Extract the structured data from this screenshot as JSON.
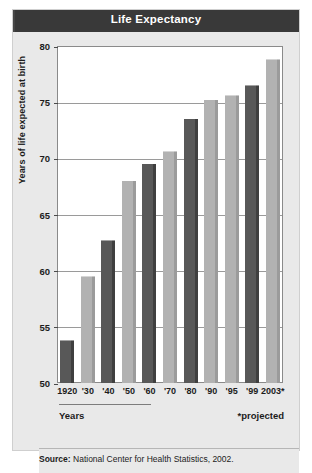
{
  "header": {
    "title": "Life Expectancy"
  },
  "axis": {
    "y_title": "Years of life expected at birth",
    "x_title": "Years",
    "footnote": "*projected"
  },
  "source": {
    "label": "Source:",
    "text": "National Center for Health Statistics, 2002."
  },
  "colors": {
    "header_bg": "#3c3c3c",
    "header_text": "#ffffff",
    "card_bg": "#e9e9e9",
    "plot_bg": "#ffffff",
    "bar_dark": "#585858",
    "bar_light": "#b2b2b2",
    "gridline": "#9a9a9a",
    "axis_text": "#1c1c1c"
  },
  "chart_data": {
    "type": "bar",
    "title": "Life Expectancy",
    "xlabel": "Years",
    "ylabel": "Years of life expected at birth",
    "ylim": [
      50,
      80
    ],
    "yticks": [
      50,
      55,
      60,
      65,
      70,
      75,
      80
    ],
    "ytick_labels": [
      "50",
      "55",
      "60",
      "65",
      "70",
      "75",
      "80"
    ],
    "grid": true,
    "legend": "none",
    "categories": [
      "1920",
      "'30",
      "'40",
      "'50",
      "'60",
      "'70",
      "'80",
      "'90",
      "'95",
      "'99",
      "2003*"
    ],
    "values": [
      54.0,
      59.7,
      62.9,
      68.2,
      69.7,
      70.8,
      73.7,
      75.4,
      75.8,
      76.7,
      79.0
    ],
    "bar_shades": [
      "dark",
      "light",
      "dark",
      "light",
      "dark",
      "light",
      "dark",
      "light",
      "light",
      "dark",
      "light"
    ],
    "annotations": [
      "*projected"
    ]
  }
}
